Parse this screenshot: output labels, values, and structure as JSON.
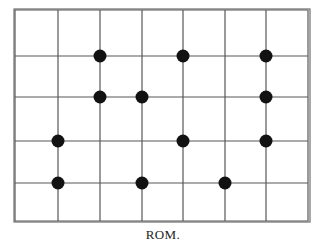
{
  "figure": {
    "caption": "ROM.",
    "colors": {
      "background": "#ffffff",
      "frame": "#6e6e6e",
      "gridline": "#575757",
      "marker": "#121212",
      "caption": "#1c1c1c"
    },
    "frame": {
      "x": 14,
      "y": 9,
      "width": 296,
      "height": 213,
      "stroke_width": 1.2
    }
  },
  "chart_data": {
    "type": "scatter",
    "title": "ROM.",
    "subtitle": "",
    "xlabel": "",
    "ylabel": "",
    "grid": true,
    "legend": null,
    "legend_position": "none",
    "marker": {
      "shape": "circle",
      "filled": true,
      "radius_px": 6.5,
      "color": "#121212"
    },
    "grid_geometry": {
      "vertical_lines_x": [
        15,
        58,
        100,
        142,
        183,
        225,
        266,
        308
      ],
      "horizontal_lines_y": [
        10,
        56,
        97,
        141,
        183,
        221
      ],
      "columns": 7,
      "rows": 5,
      "line_width": 1.2,
      "line_color": "#575757"
    },
    "axis_columns": [
      1,
      2,
      3,
      4,
      5,
      6,
      7,
      8
    ],
    "axis_rows": [
      1,
      2,
      3,
      4,
      5,
      6
    ],
    "xlim": [
      15,
      308
    ],
    "ylim": [
      10,
      221
    ],
    "points": [
      {
        "col": 3,
        "row": 2,
        "x": 100,
        "y": 56
      },
      {
        "col": 5,
        "row": 2,
        "x": 183,
        "y": 56
      },
      {
        "col": 7,
        "row": 2,
        "x": 266,
        "y": 56
      },
      {
        "col": 3,
        "row": 3,
        "x": 100,
        "y": 97
      },
      {
        "col": 4,
        "row": 3,
        "x": 142,
        "y": 97
      },
      {
        "col": 7,
        "row": 3,
        "x": 266,
        "y": 97
      },
      {
        "col": 2,
        "row": 4,
        "x": 58,
        "y": 141
      },
      {
        "col": 5,
        "row": 4,
        "x": 183,
        "y": 141
      },
      {
        "col": 7,
        "row": 4,
        "x": 266,
        "y": 141
      },
      {
        "col": 2,
        "row": 5,
        "x": 58,
        "y": 183
      },
      {
        "col": 4,
        "row": 5,
        "x": 142,
        "y": 183
      },
      {
        "col": 6,
        "row": 5,
        "x": 225,
        "y": 183
      }
    ],
    "point_count": 12
  }
}
